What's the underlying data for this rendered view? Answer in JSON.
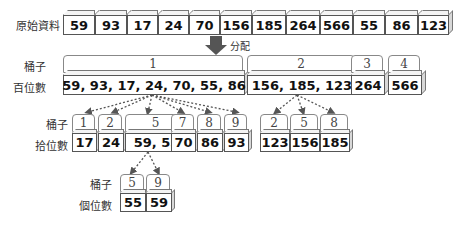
{
  "original": {
    "label": "原始資料",
    "values": [
      "59",
      "93",
      "17",
      "24",
      "70",
      "156",
      "185",
      "264",
      "566",
      "55",
      "86",
      "123"
    ]
  },
  "distribute": {
    "label": "分配",
    "arrow_color": "#555555"
  },
  "hundreds": {
    "bucket_label": "桶子",
    "row_label": "百位數",
    "buckets": [
      {
        "id": "1",
        "values": "59, 93, 17, 24, 70, 55, 86"
      },
      {
        "id": "2",
        "values": "156, 185, 123"
      },
      {
        "id": "3",
        "values": "264"
      },
      {
        "id": "4",
        "values": "566"
      }
    ]
  },
  "tens_group1": {
    "bucket_label": "桶子",
    "row_label": "拾位數",
    "buckets": [
      {
        "id": "1",
        "values": "17"
      },
      {
        "id": "2",
        "values": "24"
      },
      {
        "id": "5",
        "values": "59, 55"
      },
      {
        "id": "7",
        "values": "70"
      },
      {
        "id": "8",
        "values": "86"
      },
      {
        "id": "9",
        "values": "93"
      }
    ]
  },
  "tens_group2": {
    "buckets": [
      {
        "id": "2",
        "values": "123"
      },
      {
        "id": "5",
        "values": "156"
      },
      {
        "id": "8",
        "values": "185"
      }
    ]
  },
  "ones": {
    "bucket_label": "桶子",
    "row_label": "個位數",
    "buckets": [
      {
        "id": "5",
        "values": "55"
      },
      {
        "id": "9",
        "values": "59"
      }
    ]
  }
}
